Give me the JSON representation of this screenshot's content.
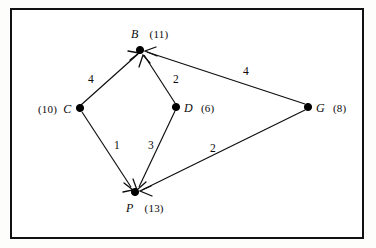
{
  "figure": {
    "type": "directed-graph",
    "background_color": "#ffffff",
    "frame_color": "#111111",
    "ink_color": "#0a0a0a"
  },
  "nodes": [
    {
      "id": "B",
      "name": "B",
      "cost": "(11)",
      "label_order": "name-first",
      "x": 140,
      "y": 50,
      "label_x": 131,
      "label_y": 28
    },
    {
      "id": "C",
      "name": "C",
      "cost": "(10)",
      "label_order": "cost-first",
      "x": 80,
      "y": 108,
      "label_x": 38,
      "label_y": 103
    },
    {
      "id": "D",
      "name": "D",
      "cost": "(6)",
      "label_order": "name-first",
      "x": 176,
      "y": 107,
      "label_x": 184,
      "label_y": 102
    },
    {
      "id": "G",
      "name": "G",
      "cost": "(8)",
      "label_order": "name-first",
      "x": 308,
      "y": 107,
      "label_x": 316,
      "label_y": 102
    },
    {
      "id": "P",
      "name": "P",
      "cost": "(13)",
      "label_order": "name-first",
      "x": 135,
      "y": 192,
      "label_x": 126,
      "label_y": 202
    }
  ],
  "edges": [
    {
      "id": "C-B",
      "from": "C",
      "to": "B",
      "weight": "4",
      "arrow_at": "B",
      "label_x": 88,
      "label_y": 74
    },
    {
      "id": "D-B",
      "from": "D",
      "to": "B",
      "weight": "2",
      "arrow_at": "B",
      "label_x": 173,
      "label_y": 74
    },
    {
      "id": "G-B",
      "from": "G",
      "to": "B",
      "weight": "4",
      "arrow_at": "B",
      "label_x": 243,
      "label_y": 66
    },
    {
      "id": "C-P",
      "from": "C",
      "to": "P",
      "weight": "1",
      "arrow_at": "P",
      "label_x": 114,
      "label_y": 140
    },
    {
      "id": "D-P",
      "from": "D",
      "to": "P",
      "weight": "3",
      "arrow_at": "P",
      "label_x": 148,
      "label_y": 140
    },
    {
      "id": "G-P",
      "from": "G",
      "to": "P",
      "weight": "2",
      "arrow_at": "P",
      "label_x": 210,
      "label_y": 143
    }
  ]
}
